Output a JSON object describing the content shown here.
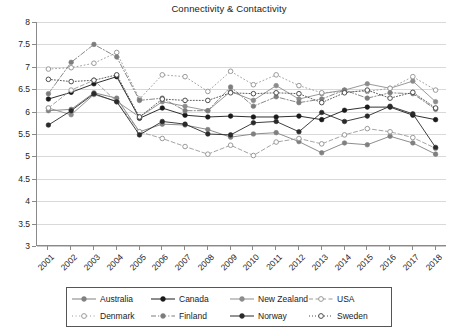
{
  "chart_data": {
    "type": "line",
    "title": "Connectivity & Contactivity",
    "xlabel": "",
    "ylabel": "",
    "ylim": [
      3,
      8
    ],
    "ytick_step": 0.5,
    "yticks": [
      "8",
      "7.5",
      "7",
      "6.5",
      "6",
      "5.5",
      "5",
      "4.5",
      "4",
      "3.5",
      "3"
    ],
    "grid": "horizontal",
    "legend_position": "bottom",
    "legend_columns": 4,
    "legend_rows": 2,
    "categories": [
      "2001",
      "2002",
      "2003",
      "2004",
      "2005",
      "2006",
      "2007",
      "2008",
      "2009",
      "2010",
      "2011",
      "2012",
      "2013",
      "2014",
      "2015",
      "2016",
      "2017",
      "2018"
    ],
    "x": [
      2001,
      2002,
      2003,
      2004,
      2005,
      2006,
      2007,
      2008,
      2009,
      2010,
      2011,
      2012,
      2013,
      2014,
      2015,
      2016,
      2017,
      2018
    ],
    "series": [
      {
        "name": "Australia",
        "color": "#808080",
        "line_style": "solid",
        "marker": "filled-circle",
        "values": [
          6.02,
          6.05,
          6.42,
          6.3,
          5.55,
          5.72,
          5.7,
          5.6,
          5.43,
          5.5,
          5.53,
          5.33,
          5.08,
          5.3,
          5.26,
          5.45,
          5.3,
          5.05
        ]
      },
      {
        "name": "Canada",
        "color": "#1a1a1a",
        "line_style": "solid",
        "marker": "filled-circle",
        "values": [
          6.28,
          6.43,
          6.62,
          6.78,
          5.85,
          6.08,
          5.92,
          5.88,
          5.9,
          5.88,
          5.88,
          5.9,
          5.82,
          6.03,
          6.1,
          6.1,
          5.92,
          5.82
        ]
      },
      {
        "name": "New Zealand",
        "color": "#8c8c8c",
        "line_style": "solid",
        "marker": "filled-circle",
        "values": [
          6.08,
          5.93,
          6.38,
          6.23,
          5.88,
          6.22,
          6.12,
          6.02,
          6.45,
          6.25,
          6.58,
          6.28,
          6.4,
          6.48,
          6.62,
          6.52,
          6.68,
          6.22
        ]
      },
      {
        "name": "USA",
        "color": "#9a9a9a",
        "line_style": "dashed",
        "marker": "open-circle",
        "values": [
          6.08,
          6.48,
          6.7,
          6.22,
          5.55,
          5.4,
          5.22,
          5.05,
          5.25,
          5.02,
          5.32,
          5.4,
          5.28,
          5.48,
          5.62,
          5.55,
          5.42,
          5.18
        ]
      },
      {
        "name": "Denmark",
        "color": "#9a9a9a",
        "line_style": "dotted-loose",
        "marker": "open-circle",
        "values": [
          6.95,
          6.98,
          7.08,
          7.32,
          6.28,
          6.82,
          6.78,
          6.45,
          6.9,
          6.6,
          6.82,
          6.58,
          6.42,
          6.45,
          6.45,
          6.52,
          6.78,
          6.48
        ]
      },
      {
        "name": "Finland",
        "color": "#7d7d7d",
        "line_style": "dash-dot",
        "marker": "filled-circle",
        "values": [
          6.4,
          7.1,
          7.5,
          7.22,
          6.25,
          6.3,
          6.02,
          6.02,
          6.55,
          6.12,
          6.33,
          6.2,
          6.28,
          6.48,
          6.3,
          6.42,
          6.4,
          6.05
        ]
      },
      {
        "name": "Norway",
        "color": "#2a2a2a",
        "line_style": "solid",
        "marker": "filled-circle",
        "values": [
          5.7,
          6.02,
          6.4,
          6.22,
          5.48,
          5.78,
          5.72,
          5.5,
          5.48,
          5.75,
          5.78,
          5.55,
          5.98,
          5.78,
          5.9,
          6.12,
          5.95,
          5.2
        ]
      },
      {
        "name": "Sweden",
        "color": "#4d4d4d",
        "line_style": "dotted",
        "marker": "open-circle",
        "values": [
          6.72,
          6.67,
          6.7,
          6.82,
          5.88,
          6.28,
          6.25,
          6.25,
          6.42,
          6.4,
          6.42,
          6.4,
          6.2,
          6.42,
          6.48,
          6.3,
          6.43,
          6.08
        ]
      }
    ]
  },
  "legend": {
    "entries": [
      {
        "label": "Australia"
      },
      {
        "label": "Canada"
      },
      {
        "label": "New Zealand"
      },
      {
        "label": "USA"
      },
      {
        "label": "Denmark"
      },
      {
        "label": "Finland"
      },
      {
        "label": "Norway"
      },
      {
        "label": "Sweden"
      }
    ]
  }
}
